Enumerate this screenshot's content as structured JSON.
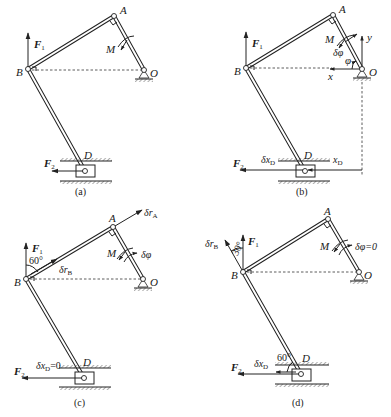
{
  "figure": {
    "panels": [
      {
        "id": "a",
        "caption": "(a)",
        "points": {
          "A": "A",
          "B": "B",
          "O": "O",
          "D": "D"
        },
        "labels": {
          "M": "M",
          "F1": "F",
          "F1_sub": "1",
          "F2": "F",
          "F2_sub": "2"
        }
      },
      {
        "id": "b",
        "caption": "(b)",
        "points": {
          "A": "A",
          "B": "B",
          "O": "O",
          "D": "D"
        },
        "labels": {
          "M": "M",
          "F1": "F",
          "F1_sub": "1",
          "F2": "F",
          "F2_sub": "2",
          "dphi": "δφ",
          "phi": "φ",
          "x": "x",
          "y": "y",
          "dxD": "δx",
          "dxD_sub": "D",
          "xD": "x",
          "xD_sub": "D"
        }
      },
      {
        "id": "c",
        "caption": "(c)",
        "points": {
          "A": "A",
          "B": "B",
          "O": "O",
          "D": "D"
        },
        "labels": {
          "M": "M",
          "F1": "F",
          "F1_sub": "1",
          "F2": "F",
          "F2_sub": "2",
          "angle60": "60°",
          "drA": "δr",
          "drA_sub": "A",
          "drB": "δr",
          "drB_sub": "B",
          "dphi": "δφ",
          "dxD0": "δx",
          "dxD0_sub": "D",
          "dxD0_val": "=0"
        }
      },
      {
        "id": "d",
        "caption": "(d)",
        "points": {
          "A": "A",
          "B": "B",
          "O": "O",
          "D": "D"
        },
        "labels": {
          "M": "M",
          "F1": "F",
          "F1_sub": "1",
          "F2": "F",
          "F2_sub": "2",
          "drB": "δr",
          "drB_sub": "B",
          "angle30": "30°",
          "angle60": "60°",
          "dphi0": "δφ=0",
          "dxD": "δx",
          "dxD_sub": "D"
        }
      }
    ]
  }
}
